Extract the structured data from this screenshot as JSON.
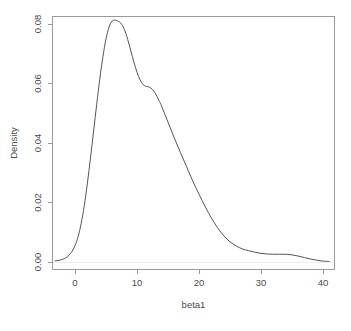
{
  "figure": {
    "title": "",
    "background_color": "#ffffff",
    "axis_color": "#9a9a9a",
    "curve_color": "#555555",
    "text_color": "#4a4a4a"
  },
  "chart_data": {
    "type": "line",
    "subtype": "kernel-density",
    "title": "",
    "xlabel": "beta1",
    "ylabel": "Density",
    "xlim": [
      -3.2,
      41.5
    ],
    "ylim": [
      0.0,
      0.0845
    ],
    "xticks": [
      0,
      10,
      20,
      30,
      40
    ],
    "xticklabels": [
      "0",
      "10",
      "20",
      "30",
      "40"
    ],
    "yticks": [
      0.0,
      0.02,
      0.04,
      0.06,
      0.08
    ],
    "yticklabels": [
      "0.00",
      "0.02",
      "0.04",
      "0.06",
      "0.08"
    ],
    "grid": false,
    "legend": null,
    "series": [
      {
        "name": "beta1 density",
        "color": "#555555",
        "x": [
          -3.2,
          -2.5,
          -2.0,
          -1.5,
          -1.0,
          -0.5,
          0.0,
          0.5,
          1.0,
          1.5,
          2.0,
          2.5,
          3.0,
          3.5,
          4.0,
          4.5,
          5.0,
          5.5,
          6.0,
          6.5,
          7.0,
          7.5,
          8.0,
          8.5,
          9.0,
          9.5,
          10.0,
          10.5,
          11.0,
          11.5,
          12.0,
          12.5,
          13.0,
          13.5,
          14.0,
          15.0,
          16.0,
          17.0,
          18.0,
          19.0,
          20.0,
          21.0,
          22.0,
          23.0,
          24.0,
          25.0,
          26.0,
          27.0,
          28.0,
          29.0,
          30.0,
          31.0,
          32.0,
          33.0,
          34.0,
          35.0,
          36.0,
          37.0,
          38.0,
          39.0,
          40.0,
          41.0
        ],
        "y": [
          0.0004,
          0.0006,
          0.0009,
          0.0014,
          0.0022,
          0.0035,
          0.0055,
          0.0085,
          0.013,
          0.019,
          0.0265,
          0.035,
          0.044,
          0.053,
          0.0615,
          0.069,
          0.075,
          0.079,
          0.081,
          0.0813,
          0.0809,
          0.08,
          0.078,
          0.0748,
          0.071,
          0.0672,
          0.0638,
          0.0612,
          0.0596,
          0.059,
          0.0588,
          0.058,
          0.0565,
          0.0545,
          0.0522,
          0.047,
          0.0418,
          0.0368,
          0.032,
          0.0272,
          0.0228,
          0.0186,
          0.0148,
          0.0115,
          0.0088,
          0.0068,
          0.0054,
          0.0044,
          0.0038,
          0.0033,
          0.0029,
          0.0027,
          0.0026,
          0.0026,
          0.0026,
          0.0024,
          0.002,
          0.0015,
          0.001,
          0.0006,
          0.0003,
          0.0002
        ]
      }
    ],
    "annotations": {
      "peak_x": 6.6,
      "peak_y": 0.0813,
      "shoulder_x": 11.8,
      "shoulder_y": 0.0589,
      "tail_bump_x": 33.0,
      "tail_bump_y": 0.0026
    }
  },
  "axes": {
    "x_axis": {
      "label": "beta1",
      "ticks": [
        {
          "value": 0,
          "label": "0"
        },
        {
          "value": 10,
          "label": "10"
        },
        {
          "value": 20,
          "label": "20"
        },
        {
          "value": 30,
          "label": "30"
        },
        {
          "value": 40,
          "label": "40"
        }
      ]
    },
    "y_axis": {
      "label": "Density",
      "ticks": [
        {
          "value": 0.0,
          "label": "0.00"
        },
        {
          "value": 0.02,
          "label": "0.02"
        },
        {
          "value": 0.04,
          "label": "0.04"
        },
        {
          "value": 0.06,
          "label": "0.06"
        },
        {
          "value": 0.08,
          "label": "0.08"
        }
      ]
    }
  }
}
